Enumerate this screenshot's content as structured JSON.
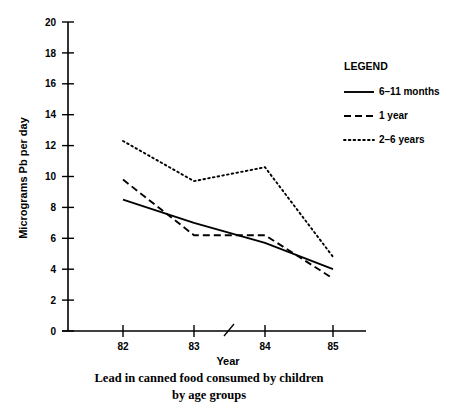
{
  "chart_data": {
    "type": "line",
    "title": "",
    "caption": [
      "Lead in canned food consumed by children",
      "by age groups"
    ],
    "xlabel": "Year",
    "ylabel": "Micrograms Pb per day",
    "categories": [
      "82",
      "83",
      "84",
      "85"
    ],
    "x": [
      82,
      83,
      84,
      85
    ],
    "xlim": [
      81.1,
      85.6
    ],
    "ylim": [
      0,
      20
    ],
    "yticks": [
      0,
      2,
      4,
      6,
      8,
      10,
      12,
      14,
      16,
      18,
      20
    ],
    "ytick_labels": [
      "0",
      "2",
      "4",
      "6",
      "8",
      "10",
      "12",
      "14",
      "16",
      "18",
      "20"
    ],
    "xtick_labels": [
      "82",
      "83",
      "84",
      "85"
    ],
    "grid": false,
    "axis_break": {
      "present": true,
      "between": [
        "83",
        "84"
      ],
      "axis": "x"
    },
    "legend": {
      "title": "LEGEND",
      "position": "top-right",
      "entries": [
        {
          "name": "6–11 months",
          "style": "solid"
        },
        {
          "name": "1 year",
          "style": "dashed"
        },
        {
          "name": "2–6 years",
          "style": "dotted"
        }
      ]
    },
    "series": [
      {
        "name": "6–11 months",
        "style": "solid",
        "values": [
          8.5,
          7.0,
          5.7,
          4.0
        ]
      },
      {
        "name": "1 year",
        "style": "dashed",
        "values": [
          9.8,
          6.2,
          6.2,
          3.4
        ]
      },
      {
        "name": "2–6 years",
        "style": "dotted",
        "values": [
          12.3,
          9.7,
          10.6,
          4.8
        ]
      }
    ],
    "colors": {
      "line": "#000000",
      "background": "#ffffff"
    }
  }
}
